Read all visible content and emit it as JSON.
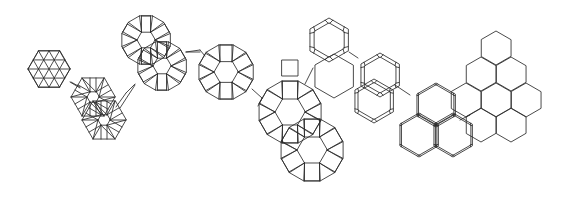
{
  "figure": {
    "width": 566,
    "height": 198,
    "background": "#ffffff",
    "line_color": "#2a2a2a",
    "description_visible_text": []
  },
  "patches": [
    {
      "name": "triangular-tiling-patch",
      "type": "tri_hex",
      "cx": 49,
      "cy": 69,
      "r": 21,
      "rot": 0
    },
    {
      "name": "rhombitrihexagonal-cluster-1",
      "type": "rosette6",
      "cx": 93,
      "cy": 97,
      "r": 22,
      "inner": 6,
      "rot": 0
    },
    {
      "name": "rhombitrihexagonal-cluster-2",
      "type": "rosette6",
      "cx": 104,
      "cy": 120,
      "r": 22,
      "inner": 6,
      "rot": 0
    },
    {
      "name": "connector-strip-1",
      "type": "strip",
      "x1": 71,
      "y1": 82,
      "x2": 80,
      "y2": 87
    },
    {
      "name": "connector-strip-2",
      "type": "strip",
      "x1": 120,
      "y1": 108,
      "x2": 135,
      "y2": 85
    },
    {
      "name": "dodecagon-rosette-top",
      "type": "rosette12",
      "cx": 146,
      "cy": 40,
      "r": 25,
      "inner": 9,
      "rot": 0
    },
    {
      "name": "dodecagon-rosette-mid",
      "type": "rosette12",
      "cx": 162,
      "cy": 66,
      "r": 25,
      "inner": 9,
      "rot": 0
    },
    {
      "name": "dodecagon-rosette-center",
      "type": "rosette12",
      "cx": 226,
      "cy": 72,
      "r": 28,
      "inner": 12,
      "rot": 0
    },
    {
      "name": "triangle-bridge-1",
      "type": "strip",
      "x1": 186,
      "y1": 52,
      "x2": 200,
      "y2": 52
    },
    {
      "name": "dodecagon-large-1",
      "type": "rosette12",
      "cx": 290,
      "cy": 112,
      "r": 32,
      "inner": 15,
      "rot": 0
    },
    {
      "name": "dodecagon-large-2",
      "type": "rosette12",
      "cx": 312,
      "cy": 150,
      "r": 32,
      "inner": 15,
      "rot": 0
    },
    {
      "name": "square-link",
      "type": "square",
      "cx": 290,
      "cy": 68,
      "s": 16
    },
    {
      "name": "truncated-hex-top",
      "type": "trunchex",
      "cx": 329,
      "cy": 40,
      "r": 22,
      "t": 0.22
    },
    {
      "name": "truncated-hex-right",
      "type": "trunchex",
      "cx": 380,
      "cy": 75,
      "r": 22,
      "t": 0.18
    },
    {
      "name": "truncated-hex-mid",
      "type": "trunchex",
      "cx": 374,
      "cy": 101,
      "r": 22,
      "t": 0.16
    },
    {
      "name": "plain-hex-link-1",
      "type": "hex",
      "cx": 334,
      "cy": 76,
      "r": 22
    },
    {
      "name": "plain-hex-link-2",
      "type": "hex",
      "cx": 334,
      "cy": 76,
      "r": 0
    },
    {
      "name": "double-hex-1",
      "type": "trunchex",
      "cx": 436,
      "cy": 105,
      "r": 22,
      "t": 0.08
    },
    {
      "name": "double-hex-2",
      "type": "trunchex",
      "cx": 419,
      "cy": 135,
      "r": 22,
      "t": 0.08
    },
    {
      "name": "double-hex-3",
      "type": "trunchex",
      "cx": 453,
      "cy": 135,
      "r": 22,
      "t": 0.08
    },
    {
      "name": "hex-link-3",
      "type": "hex",
      "cx": 402,
      "cy": 106,
      "r": 0
    },
    {
      "name": "hexagonal-tiling",
      "type": "hexgrid",
      "cells": [
        [
          496,
          48
        ],
        [
          481,
          74
        ],
        [
          511,
          74
        ],
        [
          466,
          100
        ],
        [
          496,
          100
        ],
        [
          526,
          100
        ],
        [
          481,
          125
        ],
        [
          511,
          125
        ]
      ],
      "r": 17
    }
  ],
  "connectors": [
    [
      [
        70,
        82
      ],
      [
        80,
        88
      ]
    ],
    [
      [
        116,
        107
      ],
      [
        126,
        93
      ]
    ],
    [
      [
        126,
        93
      ],
      [
        135,
        84
      ]
    ],
    [
      [
        186,
        52
      ],
      [
        200,
        50
      ]
    ],
    [
      [
        200,
        50
      ],
      [
        205,
        56
      ]
    ],
    [
      [
        252,
        89
      ],
      [
        262,
        98
      ]
    ],
    [
      [
        262,
        98
      ],
      [
        258,
        106
      ]
    ],
    [
      [
        305,
        84
      ],
      [
        313,
        68
      ]
    ],
    [
      [
        349,
        52
      ],
      [
        358,
        58
      ]
    ],
    [
      [
        395,
        85
      ],
      [
        410,
        95
      ]
    ],
    [
      [
        470,
        115
      ],
      [
        460,
        120
      ]
    ]
  ]
}
